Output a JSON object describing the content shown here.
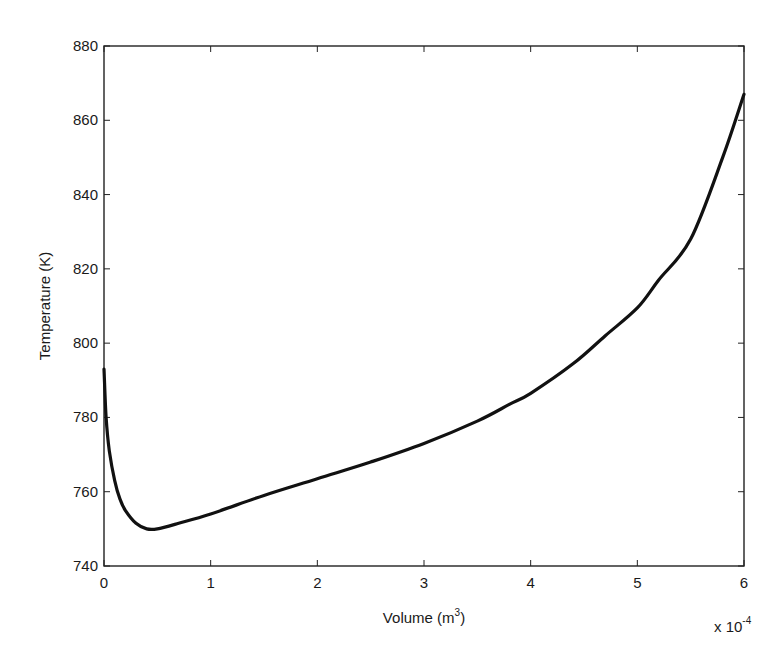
{
  "chart_data": {
    "type": "line",
    "title": "",
    "xlabel": "Volume (m3)",
    "xlabel_base": "Volume (m",
    "xlabel_sup": "3",
    "xlabel_close": ")",
    "ylabel": "Temperature (K)",
    "x_multiplier": "x 10",
    "x_multiplier_exp": "-4",
    "xlim": [
      0,
      6
    ],
    "ylim": [
      740,
      880
    ],
    "xticks": [
      "0",
      "1",
      "2",
      "3",
      "4",
      "5",
      "6"
    ],
    "yticks": [
      "740",
      "760",
      "780",
      "800",
      "820",
      "840",
      "860",
      "880"
    ],
    "grid": false,
    "legend": null,
    "series": [
      {
        "name": "Temperature",
        "color": "#111111",
        "x": [
          0.0,
          0.02,
          0.05,
          0.1,
          0.15,
          0.2,
          0.3,
          0.4,
          0.5,
          0.7,
          1.0,
          1.5,
          2.0,
          2.5,
          3.0,
          3.5,
          3.8,
          4.0,
          4.4,
          4.7,
          5.0,
          5.2,
          5.5,
          5.8,
          6.0
        ],
        "values": [
          793,
          780,
          771,
          763,
          758,
          755,
          751.5,
          750,
          750,
          751.5,
          754,
          759,
          763.5,
          768,
          773,
          779,
          783.5,
          786.5,
          794.5,
          802,
          809.5,
          817,
          828,
          850,
          867
        ]
      }
    ]
  }
}
